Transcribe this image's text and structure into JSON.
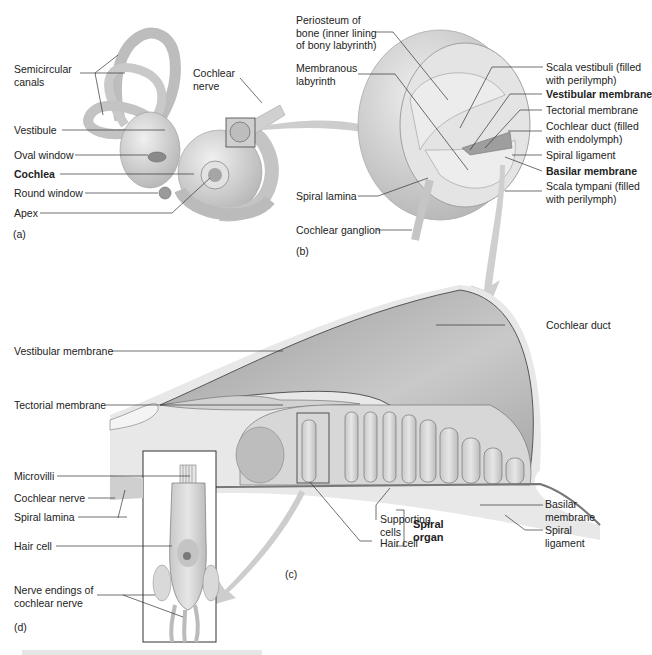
{
  "panel_a": {
    "tag": "(a)",
    "labels": {
      "semicircular_canals": "Semicircular\ncanals",
      "cochlear_nerve": "Cochlear\nnerve",
      "vestibule": "Vestibule",
      "oval_window": "Oval window",
      "cochlea": "Cochlea",
      "round_window": "Round window",
      "apex": "Apex"
    }
  },
  "panel_b": {
    "tag": "(b)",
    "labels": {
      "periosteum": "Periosteum of\nbone (inner lining\nof bony labyrinth)",
      "membranous_labyrinth": "Membranous\nlabyrinth",
      "scala_vestibuli": "Scala vestibuli (filled\nwith perilymph)",
      "vestibular_membrane": "Vestibular membrane",
      "tectorial_membrane": "Tectorial membrane",
      "cochlear_duct": "Cochlear duct (filled\nwith endolymph)",
      "spiral_ligament": "Spiral ligament",
      "basilar_membrane": "Basilar membrane",
      "scala_tympani": "Scala tympani (filled\nwith perilymph)",
      "spiral_lamina": "Spiral lamina",
      "cochlear_ganglion": "Cochlear ganglion"
    }
  },
  "panel_c": {
    "tag": "(c)",
    "labels": {
      "cochlear_duct": "Cochlear duct",
      "vestibular_membrane": "Vestibular membrane",
      "tectorial_membrane": "Tectorial membrane",
      "basilar_membrane": "Basilar\nmembrane",
      "spiral_ligament": "Spiral\nligament",
      "supporting_cells": "Supporting\ncells",
      "hair_cell": "Hair cell",
      "spiral_organ": "Spiral\norgan"
    }
  },
  "panel_d": {
    "tag": "(d)",
    "labels": {
      "microvilli": "Microvilli",
      "cochlear_nerve": "Cochlear nerve",
      "spiral_lamina": "Spiral lamina",
      "hair_cell": "Hair cell",
      "nerve_endings": "Nerve endings of\ncochlear nerve"
    }
  },
  "colors": {
    "tissue_light": "#d9d9d9",
    "tissue_mid": "#bdbdbd",
    "tissue_dark": "#8f8f8f",
    "leader_line": "#333333",
    "arrow": "#c8c8c8"
  }
}
